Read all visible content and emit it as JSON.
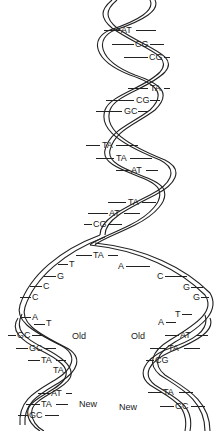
{
  "diagram": {
    "parent_helix_pairs": [
      {
        "label": "AT",
        "x": 124,
        "y": 26
      },
      {
        "label": "CG",
        "x": 136,
        "y": 40
      },
      {
        "label": "CG",
        "x": 150,
        "y": 53
      },
      {
        "label": "TA",
        "x": 150,
        "y": 84
      },
      {
        "label": "CG",
        "x": 137,
        "y": 96
      },
      {
        "label": "GC",
        "x": 125,
        "y": 107
      },
      {
        "label": "TA",
        "x": 103,
        "y": 141
      },
      {
        "label": "TA",
        "x": 117,
        "y": 154
      },
      {
        "label": "AT",
        "x": 132,
        "y": 166
      },
      {
        "label": "TA",
        "x": 128,
        "y": 198
      },
      {
        "label": "AT",
        "x": 110,
        "y": 209
      },
      {
        "label": "CG",
        "x": 94,
        "y": 220
      }
    ],
    "fork_pair": {
      "label": "TA",
      "x": 94,
      "y": 251
    },
    "left_strand_bases": [
      {
        "label": "T",
        "x": 69,
        "y": 260
      },
      {
        "label": "G",
        "x": 57,
        "y": 272
      },
      {
        "label": "C",
        "x": 43,
        "y": 282
      },
      {
        "label": "C",
        "x": 32,
        "y": 293
      },
      {
        "label": "A",
        "x": 32,
        "y": 313
      },
      {
        "label": "T",
        "x": 46,
        "y": 320
      }
    ],
    "right_strand_bases": [
      {
        "label": "A",
        "x": 118,
        "y": 262
      },
      {
        "label": "C",
        "x": 157,
        "y": 272
      },
      {
        "label": "G",
        "x": 183,
        "y": 283
      },
      {
        "label": "G",
        "x": 193,
        "y": 293
      },
      {
        "label": "T",
        "x": 175,
        "y": 310
      },
      {
        "label": "A",
        "x": 158,
        "y": 318
      }
    ],
    "left_daughter_pairs": [
      {
        "label": "GC",
        "x": 16,
        "y": 331
      },
      {
        "label": "GC",
        "x": 28,
        "y": 344
      },
      {
        "label": "TA",
        "x": 40,
        "y": 356
      },
      {
        "label": "TA",
        "x": 52,
        "y": 366
      },
      {
        "label": "AT",
        "x": 50,
        "y": 389
      },
      {
        "label": "TA",
        "x": 40,
        "y": 400
      },
      {
        "label": "GC",
        "x": 28,
        "y": 411
      }
    ],
    "right_daughter_pairs": [
      {
        "label": "AT",
        "x": 180,
        "y": 331
      },
      {
        "label": "TA",
        "x": 168,
        "y": 344
      },
      {
        "label": "CG",
        "x": 155,
        "y": 356
      },
      {
        "label": "TA",
        "x": 163,
        "y": 388
      },
      {
        "label": "GC",
        "x": 175,
        "y": 402
      }
    ],
    "strand_labels": [
      {
        "label": "Old",
        "x": 72,
        "y": 332
      },
      {
        "label": "New",
        "x": 79,
        "y": 400
      },
      {
        "label": "Old",
        "x": 131,
        "y": 332
      },
      {
        "label": "New",
        "x": 119,
        "y": 403
      }
    ]
  }
}
